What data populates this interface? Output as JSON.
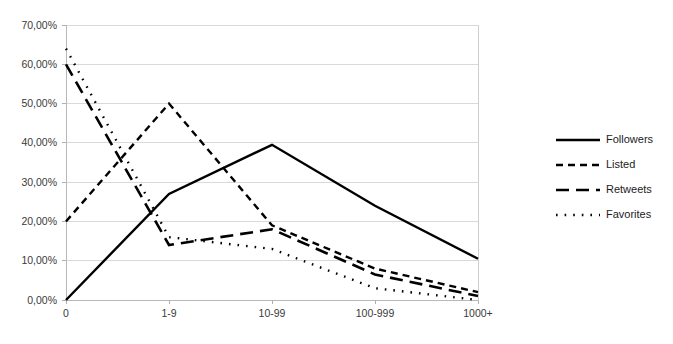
{
  "chart_data": {
    "type": "line",
    "title": "",
    "subtitle": "",
    "xlabel": "",
    "ylabel": "",
    "categories": [
      "0",
      "1-9",
      "10-99",
      "100-999",
      "1000+"
    ],
    "ylim": [
      0,
      70
    ],
    "ytick_values": [
      0,
      10,
      20,
      30,
      40,
      50,
      60,
      70
    ],
    "ytick_labels": [
      "0,00%",
      "10,00%",
      "20,00%",
      "30,00%",
      "40,00%",
      "50,00%",
      "60,00%",
      "70,00%"
    ],
    "grid": true,
    "legend_position": "right",
    "value_suffix": "%",
    "series": [
      {
        "name": "Followers",
        "style": "solid",
        "color": "#000000",
        "values": [
          0.0,
          27.0,
          39.5,
          24.0,
          10.5
        ]
      },
      {
        "name": "Listed",
        "style": "dashed",
        "color": "#000000",
        "values": [
          20.0,
          50.0,
          19.0,
          8.0,
          2.0
        ]
      },
      {
        "name": "Retweets",
        "style": "long-dash",
        "color": "#000000",
        "values": [
          60.0,
          14.0,
          18.0,
          6.5,
          1.0
        ]
      },
      {
        "name": "Favorites",
        "style": "dotted",
        "color": "#000000",
        "values": [
          64.0,
          16.0,
          13.0,
          3.0,
          0.0
        ]
      }
    ]
  },
  "legend": {
    "items": [
      {
        "label": "Followers"
      },
      {
        "label": "Listed"
      },
      {
        "label": "Retweets"
      },
      {
        "label": "Favorites"
      }
    ]
  },
  "axes": {
    "y": {
      "labels": [
        "70,00%",
        "60,00%",
        "50,00%",
        "40,00%",
        "30,00%",
        "20,00%",
        "10,00%",
        "0,00%"
      ]
    },
    "x": {
      "labels": [
        "0",
        "1-9",
        "10-99",
        "100-999",
        "1000+"
      ]
    }
  }
}
